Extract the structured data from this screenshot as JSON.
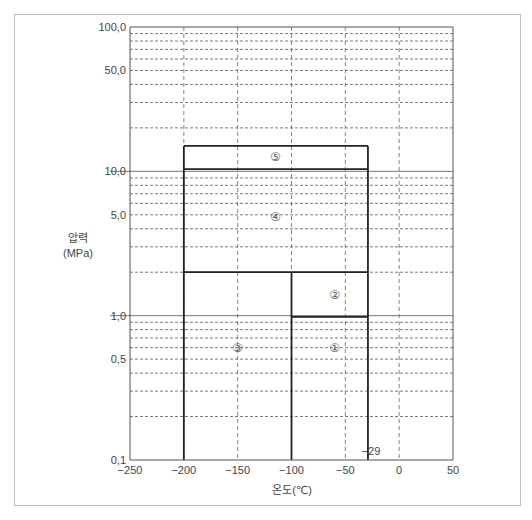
{
  "header": {
    "caption_fragment": "· · · · · · · · · · · ·"
  },
  "chart_data": {
    "type": "area",
    "title": "",
    "xlabel": "온도(℃)",
    "ylabel_line1": "압력",
    "ylabel_line2": "(MPa)",
    "xlim": [
      -250,
      50
    ],
    "ylim": [
      0.1,
      100
    ],
    "yscale": "log",
    "grid": true,
    "x_ticks": [
      -250,
      -200,
      -150,
      -100,
      -50,
      0,
      50
    ],
    "x_tick_labels": [
      "−250",
      "−200",
      "−150",
      "−100",
      "−50",
      "0",
      "50"
    ],
    "y_tick_values": [
      100,
      50,
      10,
      5,
      1,
      0.5,
      0.1
    ],
    "y_tick_labels": [
      "100,0",
      "50,0",
      "10,0",
      "5,0",
      "1,0",
      "0,5",
      "0,1"
    ],
    "y_minor_dashed": [
      0.2,
      0.3,
      0.4,
      0.5,
      0.6,
      0.7,
      0.8,
      0.9,
      2,
      3,
      4,
      5,
      6,
      7,
      8,
      9,
      20,
      30,
      40,
      50,
      60,
      70,
      80,
      90
    ],
    "y_solid_gridlines": [
      1,
      10
    ],
    "x_dashed_gridlines": [
      -200,
      -150,
      -100,
      -50,
      0
    ],
    "annotations": [
      {
        "text": "−29",
        "x": -29,
        "y": 0.12
      }
    ],
    "regions": [
      {
        "label": "①",
        "x_range": [
          -100,
          -29
        ],
        "p_range": [
          0.1,
          0.98
        ]
      },
      {
        "label": "②",
        "x_range": [
          -100,
          -29
        ],
        "p_range": [
          0.98,
          2.0
        ]
      },
      {
        "label": "③",
        "x_range": [
          -200,
          -100
        ],
        "p_range": [
          0.1,
          2.0
        ]
      },
      {
        "label": "④",
        "x_range": [
          -200,
          -29
        ],
        "p_range": [
          2.0,
          10.35
        ]
      },
      {
        "label": "⑤",
        "x_range": [
          -200,
          -29
        ],
        "p_range": [
          10.35,
          15.0
        ]
      }
    ],
    "region_label_positions": [
      {
        "label": "①",
        "x": -60,
        "p": 0.6
      },
      {
        "label": "②",
        "x": -60,
        "p": 1.4
      },
      {
        "label": "③",
        "x": -150,
        "p": 0.6
      },
      {
        "label": "④",
        "x": -115,
        "p": 4.8
      },
      {
        "label": "⑤",
        "x": -115,
        "p": 12.6
      }
    ]
  }
}
